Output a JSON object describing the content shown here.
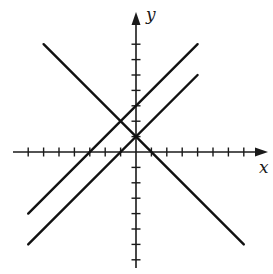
{
  "diagram": {
    "type": "coordinate-plane",
    "axes": {
      "x_label": "x",
      "y_label": "y",
      "x_ticks": [
        -7,
        -6,
        -5,
        -4,
        -3,
        -2,
        -1,
        1,
        2,
        3,
        4,
        5,
        6,
        7
      ],
      "y_ticks": [
        -7,
        -6,
        -5,
        -4,
        -3,
        -2,
        -1,
        1,
        2,
        3,
        4,
        5,
        6,
        7
      ],
      "color": "#1a1a1a"
    },
    "lines": [
      {
        "name": "descending-line",
        "equation": "y = -x + 1",
        "slope": -1,
        "intercept": 1,
        "x_range": [
          -6,
          7
        ]
      },
      {
        "name": "upper-ascending-line",
        "equation": "y = x + 3",
        "slope": 1,
        "intercept": 3,
        "x_range": [
          -7,
          4
        ]
      },
      {
        "name": "lower-ascending-line",
        "equation": "y = x + 1",
        "slope": 1,
        "intercept": 1,
        "x_range": [
          -7,
          4
        ]
      }
    ],
    "intersections": [
      {
        "x": -1,
        "y": 2,
        "between": [
          "descending-line",
          "upper-ascending-line"
        ]
      },
      {
        "x": 0,
        "y": 1,
        "between": [
          "descending-line",
          "lower-ascending-line"
        ]
      }
    ]
  },
  "layout": {
    "origin_px": [
      136,
      152
    ],
    "unit_px": 15.4
  }
}
